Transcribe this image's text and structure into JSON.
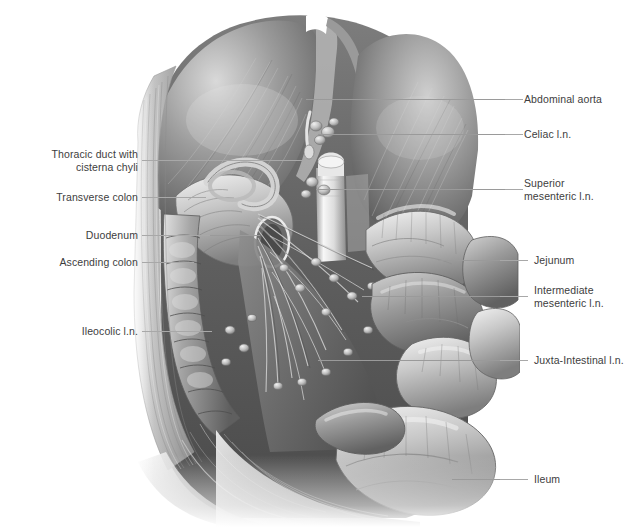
{
  "figure": {
    "style": "grayscale medical illustration",
    "background_color": "#ffffff",
    "leader_line_color": "#9a9a9a",
    "label_text_color": "#3d3d3d"
  },
  "labels": {
    "left": [
      {
        "id": "thoracic-duct",
        "text": "Thoracic duct with\ncisterna chyli",
        "lines": 2,
        "text_x": 30,
        "text_y": 148,
        "text_width": 108,
        "leader_x": 142,
        "leader_y": 160,
        "leader_width": 164
      },
      {
        "id": "transverse-colon",
        "text": "Transverse colon",
        "lines": 1,
        "text_x": 22,
        "text_y": 191,
        "text_width": 116,
        "leader_x": 142,
        "leader_y": 197,
        "leader_width": 64
      },
      {
        "id": "duodenum",
        "text": "Duodenum",
        "lines": 1,
        "text_x": 52,
        "text_y": 229,
        "text_width": 86,
        "leader_x": 142,
        "leader_y": 235,
        "leader_width": 68
      },
      {
        "id": "ascending-colon",
        "text": "Ascending colon",
        "lines": 1,
        "text_x": 26,
        "text_y": 256,
        "text_width": 112,
        "leader_x": 142,
        "leader_y": 262,
        "leader_width": 52
      },
      {
        "id": "ileocolic-ln",
        "text": "Ileocolic l.n.",
        "lines": 1,
        "text_x": 46,
        "text_y": 325,
        "text_width": 92,
        "leader_x": 142,
        "leader_y": 331,
        "leader_width": 70
      }
    ],
    "right": [
      {
        "id": "abdominal-aorta",
        "text": "Abdominal aorta",
        "lines": 1,
        "text_x": 524,
        "text_y": 93,
        "leader_x": 505,
        "leader_y": 99,
        "leader_width": 18
      },
      {
        "id": "celiac-ln",
        "text": "Celiac l.n.",
        "lines": 1,
        "text_x": 524,
        "text_y": 128,
        "leader_x": 505,
        "leader_y": 134,
        "leader_width": 18
      },
      {
        "id": "superior-mesenteric-ln",
        "text": "Superior\nmesenteric l.n.",
        "lines": 2,
        "text_x": 524,
        "text_y": 177,
        "leader_x": 505,
        "leader_y": 189,
        "leader_width": 18
      },
      {
        "id": "jejunum",
        "text": "Jejunum",
        "lines": 1,
        "text_x": 534,
        "text_y": 254,
        "leader_x": 500,
        "leader_y": 260,
        "leader_width": 28
      },
      {
        "id": "intermediate-mesenteric-ln",
        "text": "Intermediate\nmesenteric l.n.",
        "lines": 2,
        "text_x": 534,
        "text_y": 284,
        "leader_x": 500,
        "leader_y": 296,
        "leader_width": 28
      },
      {
        "id": "juxta-intestinal-ln",
        "text": "Juxta-Intestinal l.n.",
        "lines": 1,
        "text_x": 534,
        "text_y": 354,
        "leader_x": 500,
        "leader_y": 360,
        "leader_width": 28
      },
      {
        "id": "ileum",
        "text": "Ileum",
        "lines": 1,
        "text_x": 534,
        "text_y": 473,
        "leader_x": 500,
        "leader_y": 479,
        "leader_width": 28
      }
    ]
  },
  "leader_segments_over_art": [
    {
      "id": "seg-aorta",
      "x": 306,
      "y": 99,
      "width": 200
    },
    {
      "id": "seg-celiac",
      "x": 318,
      "y": 134,
      "width": 188
    },
    {
      "id": "seg-suma",
      "x": 316,
      "y": 189,
      "width": 190
    },
    {
      "id": "seg-jejunum",
      "x": 438,
      "y": 260,
      "width": 64
    },
    {
      "id": "seg-intermed",
      "x": 362,
      "y": 296,
      "width": 140
    },
    {
      "id": "seg-juxta",
      "x": 318,
      "y": 360,
      "width": 184
    },
    {
      "id": "seg-ileum",
      "x": 452,
      "y": 479,
      "width": 50
    },
    {
      "id": "seg-thoracic",
      "x": 142,
      "y": 160,
      "width": 164
    },
    {
      "id": "seg-transverse",
      "x": 142,
      "y": 197,
      "width": 64
    },
    {
      "id": "seg-duodenum",
      "x": 142,
      "y": 235,
      "width": 118
    },
    {
      "id": "seg-ascending",
      "x": 142,
      "y": 262,
      "width": 52
    },
    {
      "id": "seg-ileocolic",
      "x": 142,
      "y": 331,
      "width": 70
    }
  ],
  "anatomy_structures": [
    "diaphragm (left and right domes)",
    "abdominal aorta",
    "celiac lymph nodes",
    "superior mesenteric lymph nodes",
    "intermediate mesenteric lymph nodes",
    "juxta-intestinal lymph nodes",
    "ileocolic lymph nodes",
    "duodenum",
    "jejunum",
    "ileum",
    "ascending colon",
    "transverse colon",
    "thoracic duct with cisterna chyli",
    "mesentery with radiating vessels",
    "abdominal wall musculature"
  ]
}
